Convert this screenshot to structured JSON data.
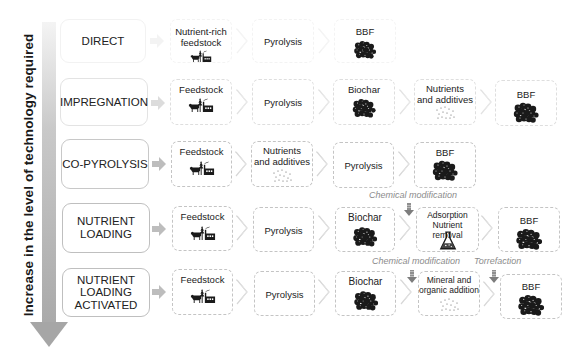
{
  "axis": {
    "label": "Increase in the level of technology required",
    "arrow_color": "#a6a6a6"
  },
  "colors": {
    "box_border": "#c4c4c4",
    "annotation_text": "#8c8c8c",
    "icon": "#1a1a1a"
  },
  "rows": [
    {
      "method": "DIRECT",
      "steps": [
        {
          "label": "Nutrient-rich feedstock",
          "icon": "livestock-factory-icon"
        },
        {
          "label": "Pyrolysis",
          "icon": null
        },
        {
          "label": "BBF",
          "icon": "granules-icon"
        }
      ]
    },
    {
      "method": "IMPREGNATION",
      "steps": [
        {
          "label": "Feedstock",
          "icon": "livestock-factory-icon"
        },
        {
          "label": "Pyrolysis",
          "icon": null
        },
        {
          "label": "Biochar",
          "icon": "granules-icon"
        },
        {
          "label": "Nutrients and additives",
          "icon": "dots-icon"
        },
        {
          "label": "BBF",
          "icon": "granules-icon"
        }
      ]
    },
    {
      "method": "CO-PYROLYSIS",
      "steps": [
        {
          "label": "Feedstock",
          "icon": "livestock-factory-icon"
        },
        {
          "label": "Nutrients and additives",
          "icon": "dots-icon"
        },
        {
          "label": "Pyrolysis",
          "icon": null
        },
        {
          "label": "BBF",
          "icon": "granules-icon"
        }
      ]
    },
    {
      "method": "NUTRIENT LOADING",
      "steps": [
        {
          "label": "Feedstock",
          "icon": "livestock-factory-icon"
        },
        {
          "label": "Pyrolysis",
          "icon": null
        },
        {
          "label": "Biochar",
          "icon": "granules-icon"
        },
        {
          "label": "Adsorption Nutrient removal",
          "line1": "Adsorption",
          "line2": "Nutrient removal",
          "icon": "flask-icon"
        },
        {
          "label": "BBF",
          "icon": "granules-icon"
        }
      ]
    },
    {
      "method": "NUTRIENT LOADING ACTIVATED",
      "method_lines": [
        "NUTRIENT",
        "LOADING",
        "ACTIVATED"
      ],
      "steps": [
        {
          "label": "Feedstock",
          "icon": "livestock-factory-icon"
        },
        {
          "label": "Pyrolysis",
          "icon": null
        },
        {
          "label": "Biochar",
          "icon": "granules-icon"
        },
        {
          "label": "Mineral and organic addition",
          "line1": "Mineral and",
          "line2": "organic addition",
          "icon": "dots-icon"
        },
        {
          "label": "BBF",
          "icon": "granules-icon"
        }
      ]
    }
  ],
  "labels": {
    "nutrient_rich_l1": "Nutrient-rich",
    "nutrient_rich_l2": "feedstock",
    "nutrients_l1": "Nutrients",
    "nutrients_l2": "and additives",
    "nutrient_l1": "NUTRIENT",
    "loading_l2": "LOADING",
    "activated_l3": "ACTIVATED"
  },
  "annotations": [
    {
      "text": "Chemical modification",
      "row": "NUTRIENT LOADING",
      "position": "above step 4"
    },
    {
      "text": "Chemical modification",
      "row": "NUTRIENT LOADING ACTIVATED",
      "position": "above step 4"
    },
    {
      "text": "Torrefaction",
      "row": "NUTRIENT LOADING ACTIVATED",
      "position": "above step 5"
    }
  ]
}
